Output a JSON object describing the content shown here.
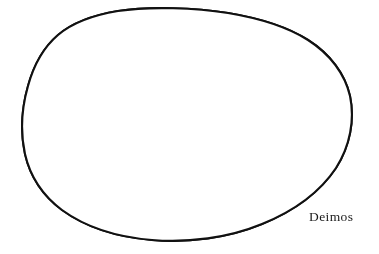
{
  "figure": {
    "title": "Deimos",
    "subject_name": "Deimos",
    "kind": "line-art astronomical illustration",
    "background_color": "#ffffff",
    "ink_color": "#111111",
    "label_color": "#1b1b1b",
    "shading_color": "#555555",
    "canvas": {
      "width": 379,
      "height": 254
    }
  },
  "label": {
    "text": "Deimos",
    "x": 309,
    "y": 210,
    "font_size_px": 13.5
  },
  "body_outline": {
    "name": "deimos-silhouette",
    "stroke_width": 2.1,
    "path": "M 118 11 C 150 6 196 8 228 13 C 258 18 286 26 308 40 C 330 54 345 74 350 96 C 355 120 350 146 336 168 C 320 192 294 211 262 224 C 228 238 188 243 152 240 C 116 237 84 226 62 210 C 42 195 30 176 25 154 C 20 131 22 107 28 86 C 34 64 44 47 58 35 C 72 23 94 15 118 11 Z"
  },
  "ridges": [
    {
      "name": "ridge-major-arc",
      "path": "M 112 20 C 96 48 84 82 82 118 C 80 150 86 178 98 200"
    },
    {
      "name": "ridge-upper-sweep",
      "path": "M 114 22 C 106 46 100 66 98 86 C 96 104 98 120 104 134"
    },
    {
      "name": "ridge-left-long",
      "path": "M 74 92 C 70 118 72 146 80 172"
    },
    {
      "name": "ridge-short-right",
      "path": "M 258 58 C 270 66 278 78 282 92"
    }
  ],
  "grooves_faint": [
    {
      "name": "groove-dashed-central",
      "path": "M 96 96 C 124 90 152 88 178 92"
    },
    {
      "name": "groove-dashed-upper",
      "path": "M 104 82 C 130 76 156 75 176 78"
    }
  ],
  "craters_major": [
    {
      "name": "crater-large-central-right",
      "cx": 220,
      "cy": 142,
      "rx": 15,
      "ry": 13,
      "floor_tone": "dark-stipple"
    },
    {
      "name": "crater-medium-center",
      "cx": 162,
      "cy": 116,
      "rx": 11.5,
      "ry": 10,
      "floor_tone": "dark-stipple"
    },
    {
      "name": "crater-upper-left",
      "cx": 92,
      "cy": 70,
      "rx": 11,
      "ry": 10,
      "floor_tone": "dark-stipple"
    },
    {
      "name": "crater-upper-center",
      "cx": 178,
      "cy": 78,
      "rx": 9,
      "ry": 8,
      "floor_tone": "dark-stipple"
    },
    {
      "name": "crater-upper-right",
      "cx": 222,
      "cy": 86,
      "rx": 8,
      "ry": 7,
      "floor_tone": "dark-stipple"
    },
    {
      "name": "crater-lower-left-upper",
      "cx": 142,
      "cy": 162,
      "rx": 7.5,
      "ry": 6.5,
      "floor_tone": "dark-stipple"
    },
    {
      "name": "crater-lower-left-lower",
      "cx": 128,
      "cy": 178,
      "rx": 7.5,
      "ry": 6.5,
      "floor_tone": "dark-stipple"
    },
    {
      "name": "crater-bottom-rim",
      "cx": 155,
      "cy": 223,
      "rx": 8.5,
      "ry": 5,
      "floor_tone": "dark-stipple"
    }
  ],
  "craters_minor": [
    {
      "name": "crater-oval-top-a",
      "cx": 152,
      "cy": 33,
      "rx": 5,
      "ry": 3
    },
    {
      "name": "crater-oval-top-b",
      "cx": 194,
      "cy": 31,
      "rx": 4.5,
      "ry": 3
    },
    {
      "name": "crater-oval-right-limb",
      "cx": 272,
      "cy": 58,
      "rx": 6,
      "ry": 4
    },
    {
      "name": "crater-oval-left-edge",
      "cx": 46,
      "cy": 161,
      "rx": 3,
      "ry": 5.5
    },
    {
      "name": "crater-oval-mid-left",
      "cx": 78,
      "cy": 190,
      "rx": 5,
      "ry": 3.5
    },
    {
      "name": "crater-oval-bottom-left",
      "cx": 60,
      "cy": 136,
      "rx": 3,
      "ry": 3
    },
    {
      "name": "crater-dot-mid-right",
      "cx": 240,
      "cy": 116,
      "rx": 4,
      "ry": 3.5
    },
    {
      "name": "crater-dot-right-low",
      "cx": 253,
      "cy": 146,
      "rx": 3.5,
      "ry": 3
    },
    {
      "name": "crater-dot-center-low",
      "cx": 175,
      "cy": 156,
      "rx": 3.5,
      "ry": 3
    },
    {
      "name": "crater-dot-left-mid",
      "cx": 106,
      "cy": 120,
      "rx": 3,
      "ry": 2.8
    },
    {
      "name": "crater-dot-upper-mid",
      "cx": 131,
      "cy": 98,
      "rx": 3,
      "ry": 2.6
    },
    {
      "name": "crater-dot-far-right",
      "cx": 283,
      "cy": 103,
      "rx": 3.2,
      "ry": 3
    }
  ],
  "shading": {
    "limb_shadow_description": "dense stipple gradient along lower-right and bottom limb",
    "stipple_density_core": "moderate",
    "stipple_density_limb": "heavy"
  }
}
